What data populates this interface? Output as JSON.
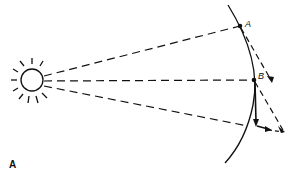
{
  "diagram": {
    "type": "orbital-motion-sunlight",
    "labels": {
      "point_a": "A",
      "point_b": "B",
      "corner_mark": "A"
    },
    "elements": {
      "sun": "sun-icon with radiating rays",
      "orbit": "curved arc (orbit segment)",
      "rays": [
        "dashed line sun to A",
        "dashed line sun to B",
        "dashed line sun to lower orbit point"
      ],
      "vectors": [
        "dashed tangent from A with arrowhead",
        "dashed resultant from B",
        "solid arrow down from B then right"
      ]
    },
    "colors": {
      "stroke": "#111111",
      "background": "#ffffff"
    }
  }
}
